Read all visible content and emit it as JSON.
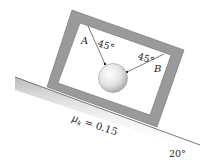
{
  "figure": {
    "labels": {
      "cord_a": "A",
      "cord_b": "B",
      "angle_a": "45°",
      "angle_b": "45°",
      "friction": "μk = 0.15",
      "friction_symbol": "μ",
      "friction_sub": "k",
      "friction_value": " = 0.15",
      "incline_angle": "20°"
    },
    "colors": {
      "frame": "#9a9a9a",
      "frame_edge": "#6e6e6e",
      "incline_shade": "#bdbdbd",
      "cord": "#444444",
      "ball_light": "#ffffff",
      "ball_dark": "#a8a8a8",
      "background": "#ffffff"
    }
  }
}
